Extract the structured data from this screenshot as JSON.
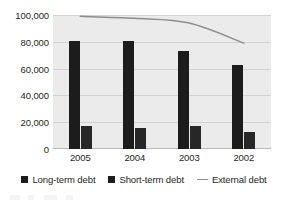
{
  "chart_data": {
    "type": "bar",
    "title": "",
    "subtitle": "",
    "xlabel": "",
    "ylabel": "",
    "categories": [
      "2005",
      "2004",
      "2003",
      "2002"
    ],
    "ylim": [
      0,
      100000
    ],
    "yticks": [
      0,
      20000,
      40000,
      60000,
      80000,
      100000
    ],
    "ytick_labels": [
      "0",
      "20,000",
      "40,000",
      "60,000",
      "80,000",
      "100,000"
    ],
    "grid": true,
    "legend_position": "bottom",
    "series": [
      {
        "name": "Long-term debt",
        "type": "bar",
        "color": "#1c1c1c",
        "values": [
          80500,
          80500,
          73000,
          62500
        ]
      },
      {
        "name": "Short-term debt",
        "type": "bar",
        "color": "#272727",
        "values": [
          17000,
          15500,
          17500,
          12500
        ]
      },
      {
        "name": "External debt",
        "type": "line",
        "color": "#8e8e8e",
        "values": [
          99000,
          97500,
          94000,
          79000
        ]
      }
    ]
  },
  "legend": {
    "items": [
      {
        "label": "Long-term debt",
        "marker": "square-swatch-icon"
      },
      {
        "label": "Short-term debt",
        "marker": "square-swatch-icon"
      },
      {
        "label": "External debt",
        "marker": "line-swatch-icon"
      }
    ]
  }
}
